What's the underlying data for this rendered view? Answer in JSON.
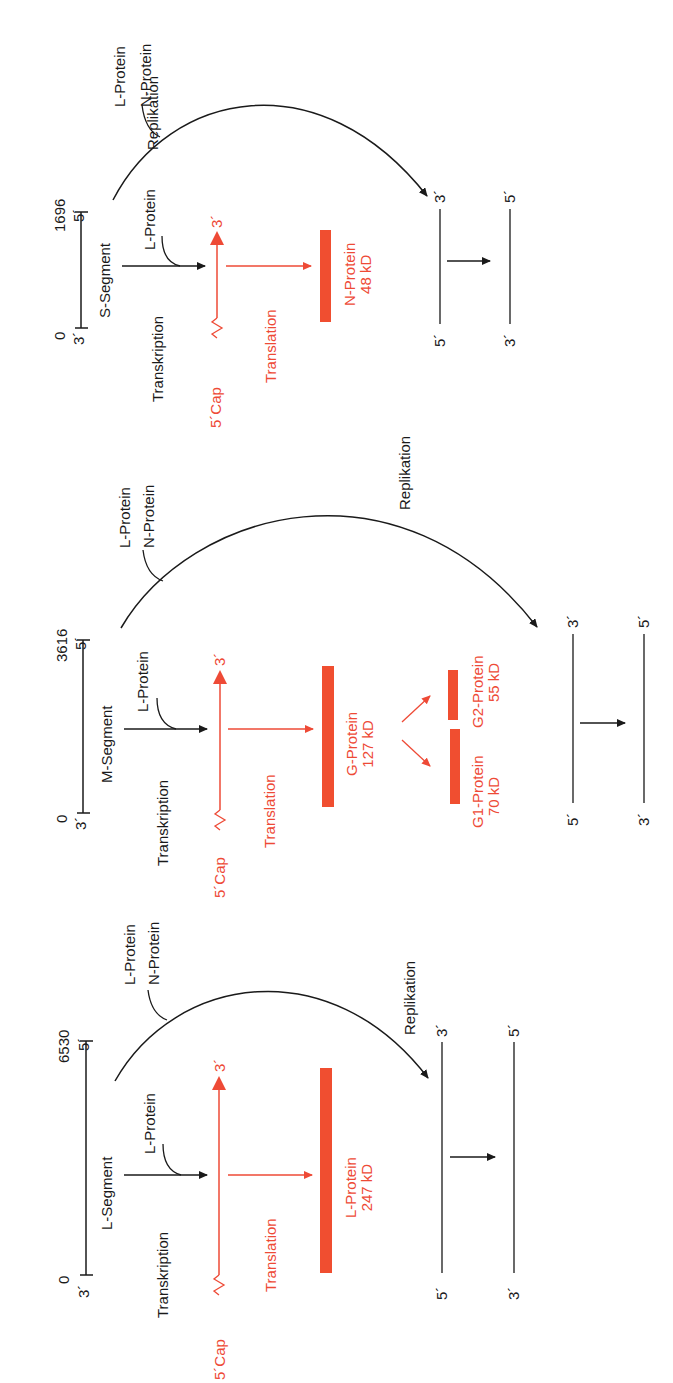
{
  "colors": {
    "black": "#1a1a1a",
    "red": "#ee4a36",
    "bar_red": "#f04e30"
  },
  "segments": [
    {
      "id": "S",
      "name": "S-Segment",
      "start_pos": "0",
      "end_pos": "1696",
      "end3": "3´",
      "end5": "5´",
      "transcription_label": "Transkription",
      "transcription_cofactor": "L-Protein",
      "replication_cofactor_1": "L-Protein",
      "replication_cofactor_2": "N-Protein",
      "replication_label": "Replikation",
      "mrna_cap": "5´Cap",
      "mrna_end": "3´",
      "translation_label": "Translation",
      "protein_name": "N-Protein",
      "protein_size": "48 kD",
      "rep_strand1_top": "3´",
      "rep_strand1_bottom": "5´",
      "rep_strand2_top": "5´",
      "rep_strand2_bottom": "3´"
    },
    {
      "id": "M",
      "name": "M-Segment",
      "start_pos": "0",
      "end_pos": "3616",
      "end3": "3´",
      "end5": "5´",
      "transcription_label": "Transkription",
      "transcription_cofactor": "L-Protein",
      "replication_cofactor_1": "L-Protein",
      "replication_cofactor_2": "N-Protein",
      "replication_label": "Replikation",
      "mrna_cap": "5´Cap",
      "mrna_end": "3´",
      "translation_label": "Translation",
      "protein_name": "G-Protein",
      "protein_size": "127 kD",
      "cleavage_products": [
        {
          "name": "G1-Protein",
          "size": "70 kD"
        },
        {
          "name": "G2-Protein",
          "size": "55 kD"
        }
      ],
      "rep_strand1_top": "3´",
      "rep_strand1_bottom": "5´",
      "rep_strand2_top": "5´",
      "rep_strand2_bottom": "3´"
    },
    {
      "id": "L",
      "name": "L-Segment",
      "start_pos": "0",
      "end_pos": "6530",
      "end3": "3´",
      "end5": "5´",
      "transcription_label": "Transkription",
      "transcription_cofactor": "L-Protein",
      "replication_cofactor_1": "L-Protein",
      "replication_cofactor_2": "N-Protein",
      "replication_label": "Replikation",
      "mrna_cap": "5´Cap",
      "mrna_end": "3´",
      "translation_label": "Translation",
      "protein_name": "L-Protein",
      "protein_size": "247 kD",
      "rep_strand1_top": "3´",
      "rep_strand1_bottom": "5´",
      "rep_strand2_top": "5´",
      "rep_strand2_bottom": "3´"
    }
  ]
}
